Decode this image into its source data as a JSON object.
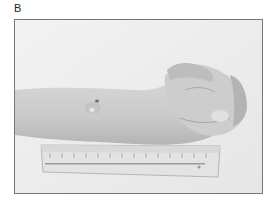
{
  "figure": {
    "panel_label": "B",
    "photo": {
      "description": "Grayscale clinical photograph of a forearm and closed hand resting on a ruler, with a small raised lesion on the dorsal wrist",
      "subjects": [
        "forearm",
        "closed hand",
        "wrist lesion",
        "ruler"
      ],
      "colors": {
        "background": "#eeeeee",
        "skin": "#cfcfcf",
        "skin_shadow": "#b5b5b5",
        "ruler": "#e4e4e4",
        "border": "#777777"
      }
    }
  }
}
